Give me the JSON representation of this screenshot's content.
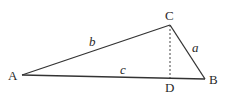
{
  "diagram": {
    "type": "triangle",
    "colors": {
      "stroke": "#333333",
      "text": "#2a2a2a",
      "background": "#ffffff"
    },
    "vertices": [
      {
        "id": "A",
        "label": "A",
        "x": 22,
        "y": 75
      },
      {
        "id": "B",
        "label": "B",
        "x": 205,
        "y": 79
      },
      {
        "id": "C",
        "label": "C",
        "x": 170,
        "y": 25
      }
    ],
    "foot": {
      "id": "D",
      "label": "D",
      "x": 170,
      "y": 78
    },
    "sides": [
      {
        "id": "a",
        "label": "a",
        "from": "C",
        "to": "B"
      },
      {
        "id": "b",
        "label": "b",
        "from": "A",
        "to": "C"
      },
      {
        "id": "c",
        "label": "c",
        "from": "A",
        "to": "B"
      }
    ],
    "altitude": {
      "from": "C",
      "to": "D",
      "style": "dashed"
    }
  }
}
